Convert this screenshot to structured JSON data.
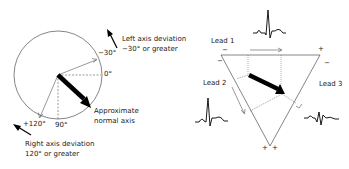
{
  "axis_wheel": {
    "labels": {
      "minus30": "−30°",
      "zero": "0°",
      "plus120": "+120°",
      "ninety": "90°"
    },
    "left_deviation": {
      "line1": "Left axis deviation",
      "line2": "−30° or greater"
    },
    "right_deviation": {
      "line1": "Right axis deviation",
      "line2": "120° or greater"
    },
    "normal_axis": {
      "line1": "Approximate",
      "line2": "normal axis"
    }
  },
  "einthoven_triangle": {
    "lead1": "Lead 1",
    "lead2": "Lead 2",
    "lead3": "Lead 3",
    "signs": {
      "top_left_minus": "−",
      "top_left_minus2": "−",
      "top_right_plus": "+",
      "top_right_minus": "−",
      "bottom_plus_left": "+",
      "bottom_plus_right": "+"
    }
  }
}
